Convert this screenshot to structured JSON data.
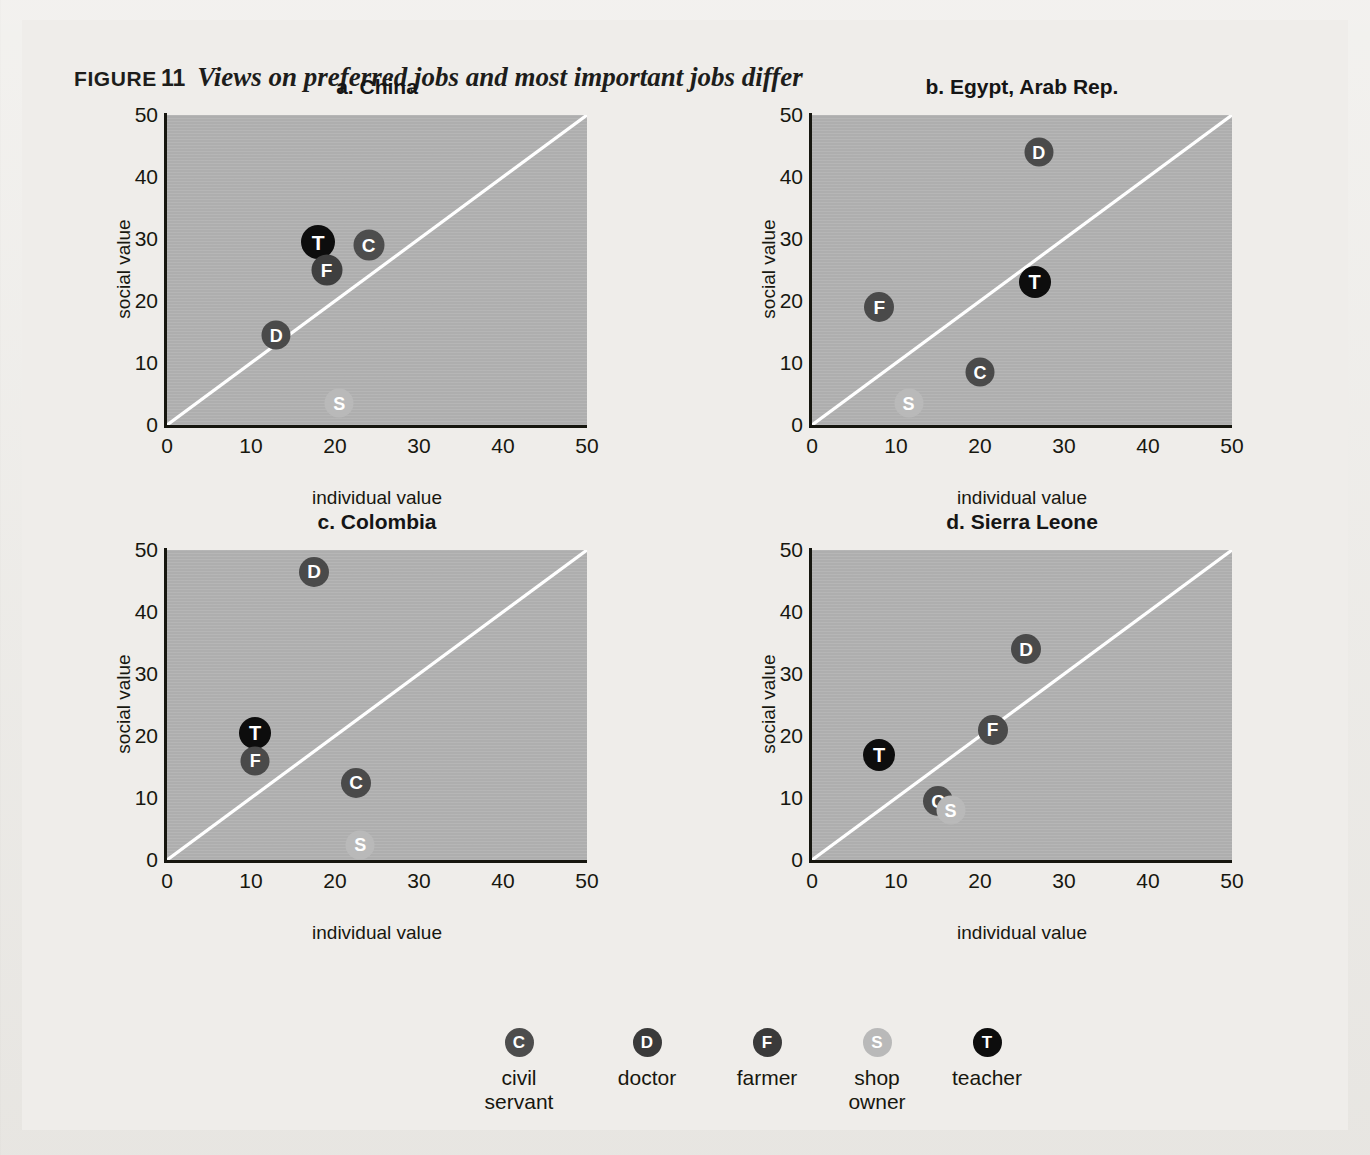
{
  "figure": {
    "label": "FIGURE",
    "number": "11",
    "title": "Views on preferred jobs and most important jobs differ"
  },
  "axes": {
    "xlabel": "individual value",
    "ylabel": "social value",
    "xticks": [
      "0",
      "10",
      "20",
      "30",
      "40",
      "50"
    ],
    "yticks": [
      "0",
      "10",
      "20",
      "30",
      "40",
      "50"
    ],
    "xlim": [
      0,
      50
    ],
    "ylim": [
      0,
      50
    ]
  },
  "legend": {
    "items": [
      {
        "code": "C",
        "label": "civil\nservant",
        "color": "#4d4d4d"
      },
      {
        "code": "D",
        "label": "doctor",
        "color": "#3a3a3a"
      },
      {
        "code": "F",
        "label": "farmer",
        "color": "#3a3a3a"
      },
      {
        "code": "S",
        "label": "shop\nowner",
        "color": "#b9b9b9"
      },
      {
        "code": "T",
        "label": "teacher",
        "color": "#0d0d0d"
      }
    ]
  },
  "colors": {
    "page_background": "#efedea",
    "plot_background": "#b2b2b2",
    "axis": "#16160f",
    "diagonal_line": "#ffffff",
    "civil_servant": "#4d4d4d",
    "doctor": "#3a3a3a",
    "farmer": "#3a3a3a",
    "shop_owner": "#b9b9b9",
    "teacher": "#0d0d0d"
  },
  "chart_data": {
    "type": "scatter",
    "title": "Views on preferred jobs and most important jobs differ",
    "xlabel": "individual value",
    "ylabel": "social value",
    "xlim": [
      0,
      50
    ],
    "ylim": [
      0,
      50
    ],
    "grid": false,
    "reference_line": {
      "type": "identity",
      "from": [
        0,
        0
      ],
      "to": [
        50,
        50
      ],
      "color": "#ffffff"
    },
    "legend_position": "bottom",
    "panels": [
      {
        "key": "a",
        "label": "a.",
        "name": "China",
        "title": "a.  China",
        "points": [
          {
            "code": "T",
            "name": "teacher",
            "x": 18.0,
            "y": 29.5,
            "color": "#0d0d0d",
            "size": 34
          },
          {
            "code": "C",
            "name": "civil servant",
            "x": 24.0,
            "y": 29.0,
            "color": "#4d4d4d",
            "size": 31
          },
          {
            "code": "F",
            "name": "farmer",
            "x": 19.0,
            "y": 25.0,
            "color": "#3f3f3f",
            "size": 31
          },
          {
            "code": "D",
            "name": "doctor",
            "x": 13.0,
            "y": 14.5,
            "color": "#4a4a4a",
            "size": 29
          },
          {
            "code": "S",
            "name": "shop owner",
            "x": 20.5,
            "y": 3.5,
            "color": "#b9b9b9",
            "size": 29
          }
        ]
      },
      {
        "key": "b",
        "label": "b.",
        "name": "Egypt, Arab Rep.",
        "title": "b.  Egypt, Arab Rep.",
        "points": [
          {
            "code": "D",
            "name": "doctor",
            "x": 27.0,
            "y": 44.0,
            "color": "#4a4a4a",
            "size": 29
          },
          {
            "code": "T",
            "name": "teacher",
            "x": 26.5,
            "y": 23.0,
            "color": "#0d0d0d",
            "size": 32
          },
          {
            "code": "F",
            "name": "farmer",
            "x": 8.0,
            "y": 19.0,
            "color": "#4a4a4a",
            "size": 30
          },
          {
            "code": "C",
            "name": "civil servant",
            "x": 20.0,
            "y": 8.5,
            "color": "#4a4a4a",
            "size": 29
          },
          {
            "code": "S",
            "name": "shop owner",
            "x": 11.5,
            "y": 3.5,
            "color": "#b9b9b9",
            "size": 29
          }
        ]
      },
      {
        "key": "c",
        "label": "c.",
        "name": "Colombia",
        "title": "c.  Colombia",
        "points": [
          {
            "code": "D",
            "name": "doctor",
            "x": 17.5,
            "y": 46.5,
            "color": "#4a4a4a",
            "size": 30
          },
          {
            "code": "T",
            "name": "teacher",
            "x": 10.5,
            "y": 20.5,
            "color": "#0d0d0d",
            "size": 32
          },
          {
            "code": "F",
            "name": "farmer",
            "x": 10.5,
            "y": 16.0,
            "color": "#4a4a4a",
            "size": 29
          },
          {
            "code": "C",
            "name": "civil servant",
            "x": 22.5,
            "y": 12.5,
            "color": "#4a4a4a",
            "size": 30
          },
          {
            "code": "S",
            "name": "shop owner",
            "x": 23.0,
            "y": 2.5,
            "color": "#b9b9b9",
            "size": 29
          }
        ]
      },
      {
        "key": "d",
        "label": "d.",
        "name": "Sierra Leone",
        "title": "d.  Sierra Leone",
        "points": [
          {
            "code": "D",
            "name": "doctor",
            "x": 25.5,
            "y": 34.0,
            "color": "#4a4a4a",
            "size": 30
          },
          {
            "code": "F",
            "name": "farmer",
            "x": 21.5,
            "y": 21.0,
            "color": "#4a4a4a",
            "size": 30
          },
          {
            "code": "T",
            "name": "teacher",
            "x": 8.0,
            "y": 17.0,
            "color": "#0d0d0d",
            "size": 32
          },
          {
            "code": "C",
            "name": "civil servant",
            "x": 15.0,
            "y": 9.5,
            "color": "#4a4a4a",
            "size": 30
          },
          {
            "code": "S",
            "name": "shop owner",
            "x": 16.5,
            "y": 8.0,
            "color": "#b9b9b9",
            "size": 29
          }
        ]
      }
    ]
  }
}
